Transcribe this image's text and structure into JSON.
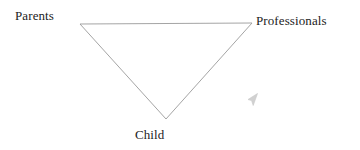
{
  "diagram": {
    "type": "inverted-triangle",
    "title": "",
    "background_color": "#ffffff",
    "line_color": "#9a9a9a",
    "text_color": "#1c1c1c",
    "nodes": [
      {
        "id": "parents",
        "label": "Parents",
        "position": "top-left"
      },
      {
        "id": "professionals",
        "label": "Professionals",
        "position": "top-right"
      },
      {
        "id": "child",
        "label": "Child",
        "position": "bottom-center"
      }
    ],
    "vertices": {
      "top_left": {
        "x": 80,
        "y": 24
      },
      "top_right": {
        "x": 252,
        "y": 23
      },
      "bottom": {
        "x": 166,
        "y": 119
      }
    },
    "edges": [
      {
        "from": "parents",
        "to": "professionals"
      },
      {
        "from": "professionals",
        "to": "child"
      },
      {
        "from": "child",
        "to": "parents"
      }
    ],
    "artifacts": {
      "cursor_name": "mouse-cursor-artifact",
      "cursor_x": 252,
      "cursor_y": 99
    }
  }
}
